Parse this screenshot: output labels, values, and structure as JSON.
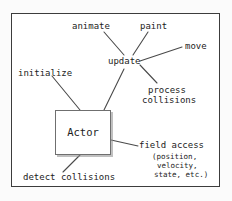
{
  "diagram": {
    "frame": {
      "border_color": "#3c3c3c",
      "background": "#ffffff"
    },
    "central_node": {
      "label": "Actor",
      "border_color": "#6f6f6f",
      "shadow_color": "#8c8c8c"
    },
    "hub_node": {
      "label": "update"
    },
    "nodes": [
      {
        "id": "animate",
        "label": "animate"
      },
      {
        "id": "paint",
        "label": "paint"
      },
      {
        "id": "move",
        "label": "move"
      },
      {
        "id": "process-collisions",
        "label_line1": "process",
        "label_line2": "collisions"
      },
      {
        "id": "initialize",
        "label": "initialize"
      },
      {
        "id": "detect-collisions",
        "label": "detect collisions"
      },
      {
        "id": "field-access",
        "label": "field access"
      }
    ],
    "field_access_detail": {
      "line1": "(position,",
      "line2": "velocity,",
      "line3": "state, etc.)"
    },
    "line_color": "#4a4a4a"
  }
}
